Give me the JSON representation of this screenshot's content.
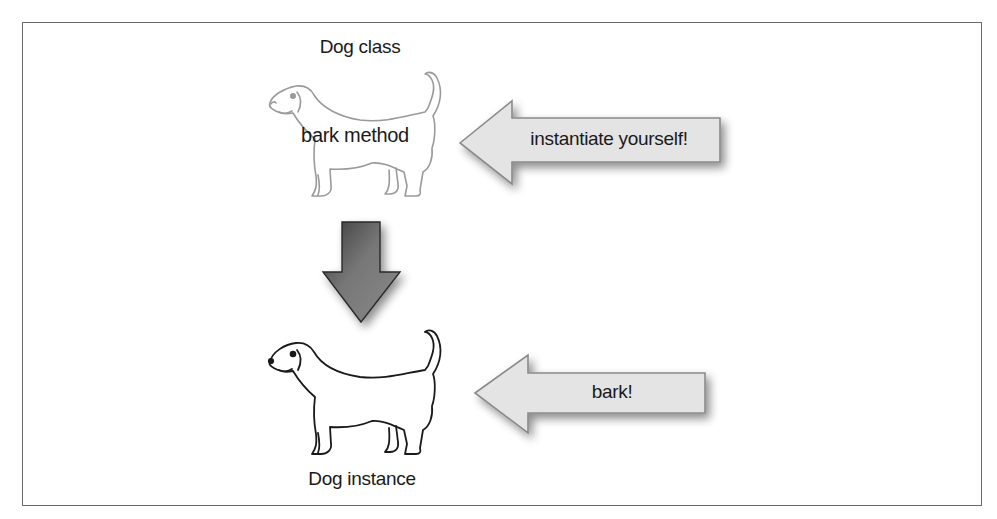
{
  "diagram": {
    "class_box": {
      "title": "Dog class",
      "method": "bark method"
    },
    "instance_box": {
      "title": "Dog instance"
    },
    "arrows": {
      "instantiate": {
        "label": "instantiate yourself!",
        "direction": "left"
      },
      "bark": {
        "label": "bark!",
        "direction": "left"
      },
      "class_to_instance": {
        "label": "",
        "direction": "down"
      }
    },
    "colors": {
      "frame": "#6a6a6a",
      "callout_arrow_fill": "#e4e4e4",
      "callout_arrow_stroke": "#8a8a8a",
      "down_arrow_fill": "#6e6e6e",
      "class_dog_stroke": "#9a9a9a",
      "instance_dog_stroke": "#1a1a1a"
    },
    "icons": {
      "class_dog": "dog-outline-faded-icon",
      "instance_dog": "dog-outline-icon"
    }
  }
}
